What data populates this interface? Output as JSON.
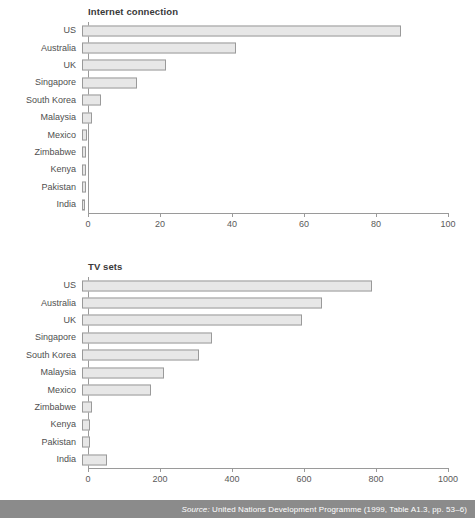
{
  "colors": {
    "bar_fill": "#e7e7e7",
    "bar_border": "#9a9a9a",
    "axis": "#9a9a9a",
    "text": "#4f4f4f",
    "source_band_bg": "#8b8b8b",
    "source_band_text": "#ffffff"
  },
  "source": {
    "label": "Source:",
    "text": " United Nations Development Programme (1999, Table A1.3, pp. 53–6)"
  },
  "chart_data": [
    {
      "type": "bar",
      "orientation": "horizontal",
      "id": "internet-connection",
      "title": "Internet connection",
      "xlabel": "",
      "ylabel": "",
      "xlim": [
        0,
        100
      ],
      "xticks": [
        0,
        20,
        40,
        60,
        80,
        100
      ],
      "xtick_labels": [
        "0",
        "20",
        "40",
        "60",
        "80",
        "100"
      ],
      "grid": false,
      "legend": "none",
      "categories": [
        "US",
        "Australia",
        "UK",
        "Singapore",
        "South Korea",
        "Malaysia",
        "Mexico",
        "Zimbabwe",
        "Kenya",
        "Pakistan",
        "India"
      ],
      "values": [
        88.6,
        42.8,
        23.3,
        15.2,
        5.3,
        2.8,
        1.4,
        1.1,
        1.1,
        1.0,
        0.8
      ]
    },
    {
      "type": "bar",
      "orientation": "horizontal",
      "id": "tv-sets",
      "title": "TV sets",
      "xlabel": "",
      "ylabel": "",
      "xlim": [
        0,
        1000
      ],
      "xticks": [
        0,
        200,
        400,
        600,
        800,
        1000
      ],
      "xtick_labels": [
        "0",
        "200",
        "400",
        "600",
        "800",
        "1000"
      ],
      "grid": false,
      "legend": "none",
      "categories": [
        "US",
        "Australia",
        "UK",
        "Singapore",
        "South Korea",
        "Malaysia",
        "Mexico",
        "Zimbabwe",
        "Kenya",
        "Pakistan",
        "India"
      ],
      "values": [
        806,
        666,
        612,
        361,
        326,
        228,
        192,
        27,
        21,
        22,
        69
      ]
    }
  ]
}
